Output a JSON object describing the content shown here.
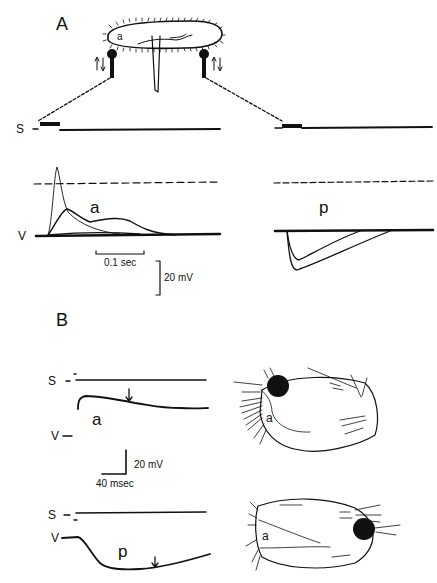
{
  "figure": {
    "panel_a": {
      "label": "A",
      "organism_label": "a",
      "stimulus_trace_label": "S",
      "voltage_trace_label": "V",
      "anterior_response_label": "a",
      "posterior_response_label": "p",
      "time_scale": "0.1 sec",
      "voltage_scale": "20 mV"
    },
    "panel_b": {
      "label": "B",
      "top_stimulus_label": "S",
      "top_voltage_label": "V",
      "top_response_label": "a",
      "top_organism_label": "a",
      "voltage_scale": "20 mV",
      "time_scale": "40 msec",
      "bottom_stimulus_label": "S",
      "bottom_voltage_label": "V",
      "bottom_response_label": "p",
      "bottom_organism_label": "a"
    }
  },
  "colors": {
    "ink": "#111111",
    "background": "#ffffff"
  }
}
